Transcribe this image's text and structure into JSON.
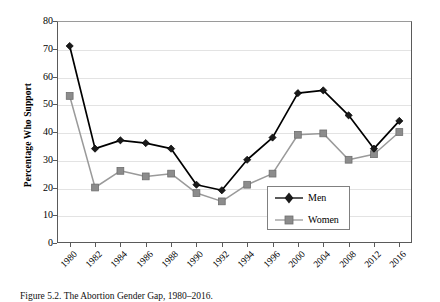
{
  "figure": {
    "caption": "Figure 5.2. The Abortion Gender Gap, 1980–2016."
  },
  "chart_data": {
    "type": "line",
    "title": "",
    "xlabel": "",
    "ylabel": "Percentage Who Support",
    "categories": [
      "1980",
      "1982",
      "1984",
      "1986",
      "1988",
      "1990",
      "1992",
      "1994",
      "1996",
      "2000",
      "2004",
      "2008",
      "2012",
      "2016"
    ],
    "ylim": [
      0,
      80
    ],
    "ytick_step": 10,
    "yticks": [
      "0",
      "10",
      "20",
      "30",
      "40",
      "50",
      "60",
      "70",
      "80"
    ],
    "grid": true,
    "grid_axis": "y",
    "legend_position": "bottom-center-right",
    "series": [
      {
        "name": "Men",
        "color": "#000000",
        "marker": "diamond",
        "marker_color": "#1a1a1a",
        "values": [
          71,
          34,
          37,
          36,
          34,
          21,
          19,
          30,
          38,
          54,
          55,
          46,
          34,
          44
        ]
      },
      {
        "name": "Women",
        "color": "#9a9a9a",
        "marker": "square",
        "marker_color": "#8c8c8c",
        "values": [
          53,
          20,
          26,
          24,
          25,
          18,
          15,
          21,
          25,
          39,
          39.5,
          30,
          32,
          40
        ]
      }
    ]
  },
  "legend": {
    "items": [
      {
        "label": "Men"
      },
      {
        "label": "Women"
      }
    ]
  }
}
